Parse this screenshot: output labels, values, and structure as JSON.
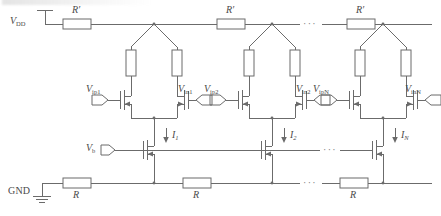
{
  "figure": {
    "kind": "circuit-schematic",
    "line_color": "#6b6b6b",
    "text_color": "#4a4a4a",
    "background": "#ffffff"
  },
  "rails": {
    "supply_label": "V",
    "supply_sub": "DD",
    "ground_label": "GND",
    "bias_label": "V",
    "bias_sub": "b",
    "supply_resistor_label": "R",
    "supply_resistor_prime": "′",
    "ground_resistor_label": "R",
    "supply_resistors": [
      {
        "label": "R",
        "prime": "′"
      },
      {
        "label": "R",
        "prime": "′"
      },
      {
        "label": "R",
        "prime": "′"
      }
    ],
    "ground_resistors": [
      {
        "label": "R"
      },
      {
        "label": "R"
      },
      {
        "label": "R"
      }
    ]
  },
  "stages": [
    {
      "index": "1",
      "input_p": {
        "label": "V",
        "sub": "ip1"
      },
      "input_n": {
        "label": "V",
        "sub": "in1"
      },
      "current": {
        "label": "I",
        "sub": "1"
      }
    },
    {
      "index": "2",
      "input_p": {
        "label": "V",
        "sub": "ip2"
      },
      "input_n": {
        "label": "V",
        "sub": "in2"
      },
      "current": {
        "label": "I",
        "sub": "2"
      }
    },
    {
      "index": "N",
      "input_p": {
        "label": "V",
        "sub": "ipN"
      },
      "input_n": {
        "label": "V",
        "sub": "inN"
      },
      "current": {
        "label": "I",
        "sub": "N"
      }
    }
  ],
  "ellipses": {
    "supply_rail": "···",
    "bias_rail": "···",
    "ground_rail": "···"
  }
}
